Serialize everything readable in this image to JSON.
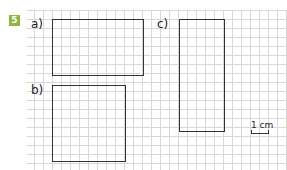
{
  "exercise": {
    "number": "5",
    "badge_color": "#8cb63c",
    "top_text": "Draw shapes on the grid",
    "parts": [
      {
        "label": "a)"
      },
      {
        "label": "b)"
      },
      {
        "label": "c)"
      }
    ],
    "scale": {
      "label": "1 cm"
    }
  }
}
